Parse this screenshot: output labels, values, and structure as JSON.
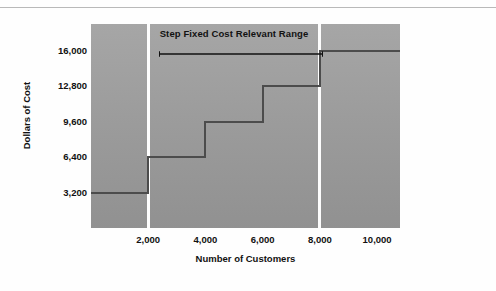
{
  "chart_data": {
    "type": "line",
    "subtype": "step",
    "title": "",
    "xlabel": "Number of Customers",
    "ylabel": "Dollars of Cost",
    "xlim": [
      0,
      10800
    ],
    "ylim": [
      0,
      18400
    ],
    "grid": false,
    "legend": null,
    "x_ticks": [
      "2,000",
      "4,000",
      "6,000",
      "8,000",
      "10,000"
    ],
    "x_tick_values": [
      2000,
      4000,
      6000,
      8000,
      10000
    ],
    "y_ticks": [
      "3,200",
      "6,400",
      "9,600",
      "12,800",
      "16,000"
    ],
    "y_tick_values": [
      3200,
      6400,
      9600,
      12800,
      16000
    ],
    "steps": [
      {
        "x_start": 0,
        "x_end": 2000,
        "value": 3200,
        "label": "3,200"
      },
      {
        "x_start": 2000,
        "x_end": 4000,
        "value": 6400,
        "label": "6,400"
      },
      {
        "x_start": 4000,
        "x_end": 6000,
        "value": 9600,
        "label": "9,600"
      },
      {
        "x_start": 6000,
        "x_end": 8000,
        "value": 12800,
        "label": "12,800"
      },
      {
        "x_start": 8000,
        "x_end": 10800,
        "value": 16000,
        "label": "16,000"
      }
    ],
    "annotations": [
      {
        "text": "Step Fixed Cost Relevant Range",
        "type": "double-headed-arrow",
        "x_start": 2000,
        "x_end": 8000
      }
    ],
    "band_dividers": [
      2000,
      8000
    ],
    "colors": {
      "plot_background_top": "#a6a6a6",
      "plot_background_bottom": "#919191",
      "step_line": "#4c4c4c",
      "divider": "#fdfdfd",
      "text": "#111111",
      "top_rule": "#b9b9b9"
    }
  },
  "axes": {
    "y_title": "Dollars of Cost",
    "x_title": "Number of Customers",
    "y_labels": [
      "16,000",
      "12,800",
      "9,600",
      "6,400",
      "3,200"
    ],
    "x_labels": [
      "2,000",
      "4,000",
      "6,000",
      "8,000",
      "10,000"
    ]
  },
  "annotation": {
    "range_label": "Step Fixed Cost Relevant Range"
  }
}
